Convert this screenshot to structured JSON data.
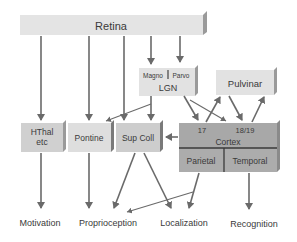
{
  "colors": {
    "box_light": "#e2e2e2",
    "box_mid": "#cfcfcf",
    "box_dark": "#a9a9a9",
    "box_side": "#8c8c8c",
    "arrow": "#6a6a6a",
    "text": "#3a3a3a"
  },
  "nodes": {
    "retina": "Retina",
    "lgn": "LGN",
    "magno": "Magno",
    "parvo": "Parvo",
    "pulvinar": "Pulvinar",
    "hthal_line1": "HThal",
    "hthal_line2": "etc",
    "pontine": "Pontine",
    "supcoll": "Sup Coll",
    "cortex": "Cortex",
    "area17": "17",
    "area1819": "18/19",
    "parietal": "Parietal",
    "temporal": "Temporal"
  },
  "outputs": {
    "motivation": "Motivation",
    "proprioception": "Proprioception",
    "localization": "Localization",
    "recognition": "Recognition"
  }
}
